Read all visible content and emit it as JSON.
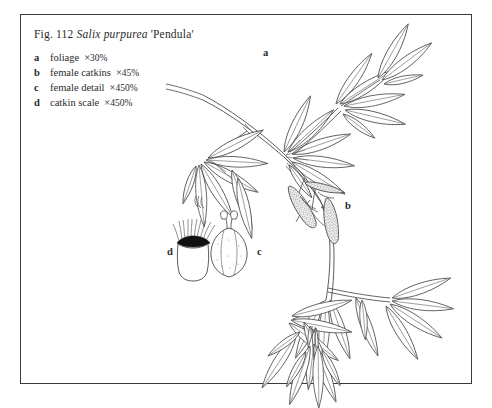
{
  "plate": {
    "figure_number": "Fig. 112",
    "species_name": "Salix purpurea",
    "cultivar": "'Pendula'",
    "title_prefix": "Fig. 112 ",
    "title_suffix": " 'Pendula'"
  },
  "legend": {
    "items": [
      {
        "key": "a",
        "label": "foliage",
        "magnification": "30%",
        "times": "×"
      },
      {
        "key": "b",
        "label": "female catkins",
        "magnification": "45%",
        "times": "×"
      },
      {
        "key": "c",
        "label": "female detail",
        "magnification": "450%",
        "times": "×"
      },
      {
        "key": "d",
        "label": "catkin scale",
        "magnification": "450%",
        "times": "×"
      }
    ]
  },
  "figure_labels": {
    "a": "a",
    "b": "b",
    "c": "c",
    "d": "d"
  },
  "colors": {
    "ink": "#2b2b2d",
    "line": "#4a4a4e",
    "frame": "#3a3a3c",
    "paper": "#ffffff",
    "scale_band": "#111111"
  },
  "illustration": {
    "subject": "willow branch with lanceolate leaves and female catkins",
    "elements": [
      "main-stem",
      "upper-leaf-cluster",
      "left-leaf-branch",
      "catkin-cluster",
      "lower-leaf-cluster",
      "ovary-detail",
      "catkin-scale-detail"
    ]
  }
}
